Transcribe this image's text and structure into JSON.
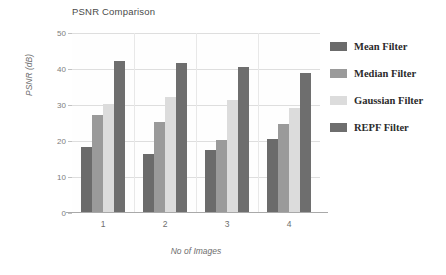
{
  "chart_data": {
    "type": "bar",
    "title": "PSNR Comparison",
    "xlabel": "No of Images",
    "ylabel": "PSNR (dB)",
    "categories": [
      "1",
      "2",
      "3",
      "4"
    ],
    "ylim": [
      0,
      50
    ],
    "yticks": [
      0,
      10,
      20,
      30,
      40,
      50
    ],
    "grid": true,
    "legend_position": "right",
    "series": [
      {
        "name": "Mean Filter",
        "color": "#6b6b6b",
        "values": [
          18.2,
          16.3,
          17.4,
          20.5
        ]
      },
      {
        "name": "Median Filter",
        "color": "#9a9a9a",
        "values": [
          27.2,
          25.2,
          20.4,
          24.6
        ]
      },
      {
        "name": "Gaussian Filter",
        "color": "#dcdcdc",
        "values": [
          30.2,
          32.3,
          31.4,
          29.3
        ]
      },
      {
        "name": "REPF Filter",
        "color": "#6e6e6e",
        "values": [
          42.2,
          41.8,
          40.6,
          38.9
        ]
      }
    ]
  }
}
